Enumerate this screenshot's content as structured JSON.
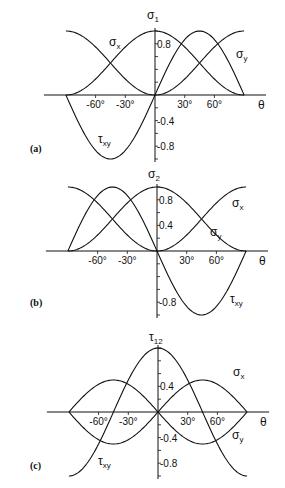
{
  "chart_data": [
    {
      "type": "line",
      "panel_label": "(a)",
      "title": "σ1",
      "title_main": "σ",
      "title_sub": "1",
      "xlabel": "θ",
      "xlim": [
        -90,
        90
      ],
      "ylim": [
        -1,
        1
      ],
      "x_ticks": [
        {
          "value": -60,
          "label": "-60°"
        },
        {
          "value": -30,
          "label": "-30°"
        },
        {
          "value": 30,
          "label": "30°"
        },
        {
          "value": 60,
          "label": "60°"
        }
      ],
      "y_ticks": [
        {
          "value": 0.8,
          "label": "0.8"
        },
        {
          "value": -0.4,
          "label": "-0.4"
        },
        {
          "value": -0.8,
          "label": "-0.8"
        }
      ],
      "series": [
        {
          "name": "σx",
          "main": "σ",
          "sub": "x",
          "segments": [
            {
              "fn": "cos2",
              "from": -90,
              "to": 0,
              "note": "left branch shown as sin²θ-like rise"
            }
          ]
        },
        {
          "name": "σy",
          "main": "σ",
          "sub": "y"
        },
        {
          "name": "τxy",
          "main": "τ",
          "sub": "xy"
        }
      ],
      "curves": [
        {
          "expr": "cos2",
          "from": -90,
          "to": 90
        },
        {
          "expr": "sin2_left",
          "from": -90,
          "to": 0
        },
        {
          "expr": "sin2",
          "from": 0,
          "to": 90
        },
        {
          "expr": "sin2t",
          "from": -90,
          "to": 90
        }
      ],
      "annotations": [
        {
          "text": "σx",
          "x": -40,
          "y": 0.9
        },
        {
          "text": "σy",
          "x": 68,
          "y": 0.75
        },
        {
          "text": "τxy",
          "x": -55,
          "y": -0.7
        }
      ]
    },
    {
      "type": "line",
      "panel_label": "(b)",
      "title": "σ2",
      "title_main": "σ",
      "title_sub": "2",
      "xlabel": "θ",
      "xlim": [
        -90,
        90
      ],
      "ylim": [
        -1,
        1
      ],
      "x_ticks": [
        {
          "value": -60,
          "label": "-60°"
        },
        {
          "value": -30,
          "label": "-30°"
        },
        {
          "value": 30,
          "label": "30°"
        },
        {
          "value": 60,
          "label": "60°"
        }
      ],
      "y_ticks": [
        {
          "value": 0.8,
          "label": "0.8"
        },
        {
          "value": 0.4,
          "label": "0.4"
        },
        {
          "value": -0.8,
          "label": "-0.8"
        }
      ],
      "series": [
        {
          "name": "σx",
          "main": "σ",
          "sub": "x"
        },
        {
          "name": "σy",
          "main": "σ",
          "sub": "y"
        },
        {
          "name": "τxy",
          "main": "τ",
          "sub": "xy"
        }
      ],
      "curves": [
        {
          "expr": "sin2",
          "from": -90,
          "to": 90
        },
        {
          "expr": "cos2",
          "from": -90,
          "to": 90
        },
        {
          "expr": "neg_sin2t",
          "from": -90,
          "to": 90
        }
      ],
      "annotations": [
        {
          "text": "σx",
          "x": 72,
          "y": 0.78
        },
        {
          "text": "σy",
          "x": 55,
          "y": 0.3
        },
        {
          "text": "τxy",
          "x": 70,
          "y": -0.7
        }
      ]
    },
    {
      "type": "line",
      "panel_label": "(c)",
      "title": "τ12",
      "title_main": "τ",
      "title_sub": "12",
      "xlabel": "θ",
      "xlim": [
        -90,
        90
      ],
      "ylim": [
        -1,
        1
      ],
      "x_ticks": [
        {
          "value": -60,
          "label": "-60°"
        },
        {
          "value": -30,
          "label": "-30°"
        },
        {
          "value": 30,
          "label": "30°"
        },
        {
          "value": 60,
          "label": "60°"
        }
      ],
      "y_ticks": [
        {
          "value": 0.4,
          "label": "0.4"
        },
        {
          "value": -0.4,
          "label": "-0.4"
        },
        {
          "value": -0.8,
          "label": "-0.8"
        }
      ],
      "series": [
        {
          "name": "σx",
          "main": "σ",
          "sub": "x"
        },
        {
          "name": "σy",
          "main": "σ",
          "sub": "y"
        },
        {
          "name": "τxy",
          "main": "τ",
          "sub": "xy"
        }
      ],
      "curves": [
        {
          "expr": "half_sin2t",
          "from": -90,
          "to": 90
        },
        {
          "expr": "neg_half_sin2t",
          "from": -90,
          "to": 90
        },
        {
          "expr": "cos2t",
          "from": -90,
          "to": 90
        }
      ],
      "annotations": [
        {
          "text": "σy",
          "x": 68,
          "y": 0.5
        },
        {
          "text": "σx",
          "x": 68,
          "y": -0.55
        },
        {
          "text": "τxy",
          "x": -55,
          "y": -0.8
        }
      ]
    }
  ],
  "layout": {
    "panels": [
      {
        "ox": 155,
        "oy": 95,
        "px_per_deg": 0.99,
        "px_per_unit": 64,
        "label_pos": [
          30,
          152
        ],
        "ann": [
          [
            109,
            46
          ],
          [
            236,
            58
          ],
          [
            98,
            143
          ]
        ],
        "title_pos": [
          147,
          19
        ],
        "theta_pos": [
          258,
          109
        ]
      },
      {
        "ox": 157,
        "oy": 251,
        "px_per_deg": 0.99,
        "px_per_unit": 64,
        "label_pos": [
          30,
          306
        ],
        "ann": [
          [
            232,
            207
          ],
          [
            210,
            236
          ],
          [
            230,
            303
          ]
        ],
        "title_pos": [
          148,
          178
        ],
        "theta_pos": [
          259,
          265
        ]
      },
      {
        "ox": 158,
        "oy": 412,
        "px_per_deg": 0.99,
        "px_per_unit": 64,
        "label_pos": [
          30,
          469
        ],
        "ann": [
          [
            233,
            376
          ],
          [
            232,
            439
          ],
          [
            98,
            465
          ]
        ],
        "title_pos": [
          149,
          341
        ],
        "theta_pos": [
          260,
          426
        ]
      }
    ]
  }
}
